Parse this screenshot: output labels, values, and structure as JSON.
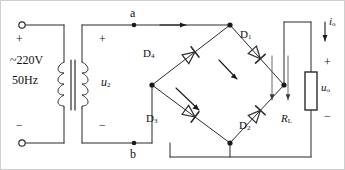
{
  "diagram": {
    "stroke_color": "#2b2b2b",
    "background": "#ffffff"
  },
  "source": {
    "voltage_label": "~220V",
    "frequency_label": "50Hz",
    "plus_label": "+",
    "minus_label": "−",
    "terminal_top_name": "input-terminal-top",
    "terminal_bottom_name": "input-terminal-bottom"
  },
  "transformer": {
    "secondary_voltage_label": "u",
    "secondary_voltage_sub": "2",
    "secondary_plus": "+",
    "secondary_minus": "−"
  },
  "nodes": {
    "a": "a",
    "b": "b"
  },
  "bridge": {
    "diodes": [
      {
        "label": "D",
        "sub": "1",
        "position": "upper-right"
      },
      {
        "label": "D",
        "sub": "2",
        "position": "lower-right"
      },
      {
        "label": "D",
        "sub": "3",
        "position": "lower-left"
      },
      {
        "label": "D",
        "sub": "4",
        "position": "upper-left"
      }
    ]
  },
  "load": {
    "resistor_label": "R",
    "resistor_sub": "L",
    "output_voltage_label": "u",
    "output_voltage_sub": "o",
    "output_current_label": "i",
    "output_current_sub": "o",
    "plus_label": "+",
    "minus_label": "−"
  }
}
